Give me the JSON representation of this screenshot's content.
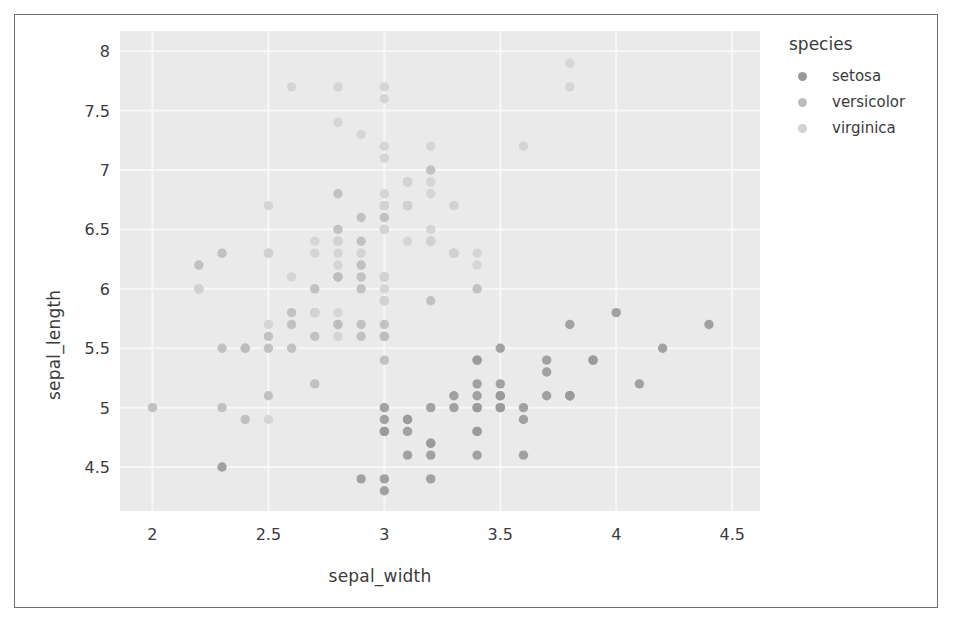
{
  "figure": {
    "background": "#ffffff",
    "border_color": "#6e6e6e",
    "panel_color": "#eaeaea",
    "grid_color": "#f7f7f7",
    "text_color": "#3b3b3b"
  },
  "legend": {
    "title": "species",
    "entries": [
      {
        "label": "setosa",
        "color": "#9a9a9a"
      },
      {
        "label": "versicolor",
        "color": "#bdbdbd"
      },
      {
        "label": "virginica",
        "color": "#d2d2d2"
      }
    ]
  },
  "axes": {
    "x_ticks": [
      "2",
      "2.5",
      "3",
      "3.5",
      "4",
      "4.5"
    ],
    "y_ticks": [
      "4.5",
      "5",
      "5.5",
      "6",
      "6.5",
      "7",
      "7.5",
      "8"
    ]
  },
  "chart_data": {
    "type": "scatter",
    "title": "",
    "xlabel": "sepal_width",
    "ylabel": "sepal_length",
    "xlim": [
      1.86,
      4.62
    ],
    "ylim": [
      4.13,
      8.17
    ],
    "xticks": [
      2,
      2.5,
      3,
      3.5,
      4,
      4.5
    ],
    "yticks": [
      4.5,
      5,
      5.5,
      6,
      6.5,
      7,
      7.5,
      8
    ],
    "grid": true,
    "legend_position": "right",
    "legend_title": "species",
    "marker_size": 7,
    "series": [
      {
        "name": "setosa",
        "color": "#9a9a9a",
        "points": [
          [
            3.5,
            5.1
          ],
          [
            3.0,
            4.9
          ],
          [
            3.2,
            4.7
          ],
          [
            3.1,
            4.6
          ],
          [
            3.6,
            5.0
          ],
          [
            3.9,
            5.4
          ],
          [
            3.4,
            4.6
          ],
          [
            3.4,
            5.0
          ],
          [
            2.9,
            4.4
          ],
          [
            3.1,
            4.9
          ],
          [
            3.7,
            5.4
          ],
          [
            3.4,
            4.8
          ],
          [
            3.0,
            4.8
          ],
          [
            3.0,
            4.3
          ],
          [
            4.0,
            5.8
          ],
          [
            4.4,
            5.7
          ],
          [
            3.9,
            5.4
          ],
          [
            3.5,
            5.1
          ],
          [
            3.8,
            5.7
          ],
          [
            3.8,
            5.1
          ],
          [
            3.4,
            5.4
          ],
          [
            3.7,
            5.1
          ],
          [
            3.6,
            4.6
          ],
          [
            3.3,
            5.1
          ],
          [
            3.4,
            4.8
          ],
          [
            3.0,
            5.0
          ],
          [
            3.4,
            5.0
          ],
          [
            3.5,
            5.2
          ],
          [
            3.4,
            5.2
          ],
          [
            3.2,
            4.7
          ],
          [
            3.1,
            4.8
          ],
          [
            3.4,
            5.4
          ],
          [
            4.1,
            5.2
          ],
          [
            4.2,
            5.5
          ],
          [
            3.1,
            4.9
          ],
          [
            3.2,
            5.0
          ],
          [
            3.5,
            5.5
          ],
          [
            3.6,
            4.9
          ],
          [
            3.0,
            4.4
          ],
          [
            3.4,
            5.1
          ],
          [
            3.5,
            5.0
          ],
          [
            2.3,
            4.5
          ],
          [
            3.2,
            4.4
          ],
          [
            3.5,
            5.0
          ],
          [
            3.8,
            5.1
          ],
          [
            3.0,
            4.8
          ],
          [
            3.8,
            5.1
          ],
          [
            3.2,
            4.6
          ],
          [
            3.7,
            5.3
          ],
          [
            3.3,
            5.0
          ]
        ]
      },
      {
        "name": "versicolor",
        "color": "#bdbdbd",
        "points": [
          [
            3.2,
            7.0
          ],
          [
            3.2,
            6.4
          ],
          [
            3.1,
            6.9
          ],
          [
            2.3,
            5.5
          ],
          [
            2.8,
            6.5
          ],
          [
            2.8,
            5.7
          ],
          [
            3.3,
            6.3
          ],
          [
            2.4,
            4.9
          ],
          [
            2.9,
            6.6
          ],
          [
            2.7,
            5.2
          ],
          [
            2.0,
            5.0
          ],
          [
            3.0,
            5.9
          ],
          [
            2.2,
            6.0
          ],
          [
            2.9,
            6.1
          ],
          [
            2.9,
            5.6
          ],
          [
            3.1,
            6.7
          ],
          [
            3.0,
            5.6
          ],
          [
            2.7,
            5.8
          ],
          [
            2.2,
            6.2
          ],
          [
            2.5,
            5.6
          ],
          [
            3.2,
            5.9
          ],
          [
            2.8,
            6.1
          ],
          [
            2.5,
            6.3
          ],
          [
            2.8,
            6.1
          ],
          [
            2.9,
            6.4
          ],
          [
            3.0,
            6.6
          ],
          [
            2.8,
            6.8
          ],
          [
            3.0,
            6.7
          ],
          [
            2.9,
            6.0
          ],
          [
            2.6,
            5.7
          ],
          [
            2.4,
            5.5
          ],
          [
            2.4,
            5.5
          ],
          [
            2.7,
            5.8
          ],
          [
            2.7,
            6.0
          ],
          [
            3.0,
            5.4
          ],
          [
            3.4,
            6.0
          ],
          [
            3.1,
            6.7
          ],
          [
            2.3,
            6.3
          ],
          [
            3.0,
            5.6
          ],
          [
            2.5,
            5.5
          ],
          [
            2.6,
            5.5
          ],
          [
            3.0,
            6.1
          ],
          [
            2.6,
            5.8
          ],
          [
            2.3,
            5.0
          ],
          [
            2.7,
            5.6
          ],
          [
            3.0,
            5.7
          ],
          [
            2.9,
            5.7
          ],
          [
            2.9,
            6.2
          ],
          [
            2.5,
            5.1
          ],
          [
            2.8,
            5.7
          ]
        ]
      },
      {
        "name": "virginica",
        "color": "#d2d2d2",
        "points": [
          [
            3.3,
            6.3
          ],
          [
            2.7,
            5.8
          ],
          [
            3.0,
            7.1
          ],
          [
            2.9,
            6.3
          ],
          [
            3.0,
            6.5
          ],
          [
            3.0,
            7.6
          ],
          [
            2.5,
            4.9
          ],
          [
            2.9,
            7.3
          ],
          [
            2.5,
            6.7
          ],
          [
            3.6,
            7.2
          ],
          [
            3.2,
            6.5
          ],
          [
            2.7,
            6.4
          ],
          [
            3.0,
            6.8
          ],
          [
            2.5,
            5.7
          ],
          [
            2.8,
            5.8
          ],
          [
            3.2,
            6.4
          ],
          [
            3.0,
            6.5
          ],
          [
            3.8,
            7.7
          ],
          [
            2.6,
            7.7
          ],
          [
            2.2,
            6.0
          ],
          [
            3.2,
            6.9
          ],
          [
            2.8,
            5.6
          ],
          [
            2.8,
            7.7
          ],
          [
            2.7,
            6.3
          ],
          [
            3.3,
            6.7
          ],
          [
            3.2,
            7.2
          ],
          [
            2.8,
            6.2
          ],
          [
            3.0,
            6.1
          ],
          [
            2.8,
            6.4
          ],
          [
            3.0,
            7.2
          ],
          [
            2.8,
            7.4
          ],
          [
            3.8,
            7.9
          ],
          [
            2.8,
            6.4
          ],
          [
            2.8,
            6.3
          ],
          [
            2.6,
            6.1
          ],
          [
            3.0,
            7.7
          ],
          [
            3.4,
            6.3
          ],
          [
            3.1,
            6.4
          ],
          [
            3.0,
            6.0
          ],
          [
            3.1,
            6.9
          ],
          [
            3.1,
            6.7
          ],
          [
            3.1,
            6.9
          ],
          [
            2.7,
            5.8
          ],
          [
            3.2,
            6.8
          ],
          [
            3.3,
            6.7
          ],
          [
            3.0,
            6.7
          ],
          [
            2.5,
            6.3
          ],
          [
            3.0,
            6.5
          ],
          [
            3.4,
            6.2
          ],
          [
            3.0,
            5.9
          ]
        ]
      }
    ]
  }
}
